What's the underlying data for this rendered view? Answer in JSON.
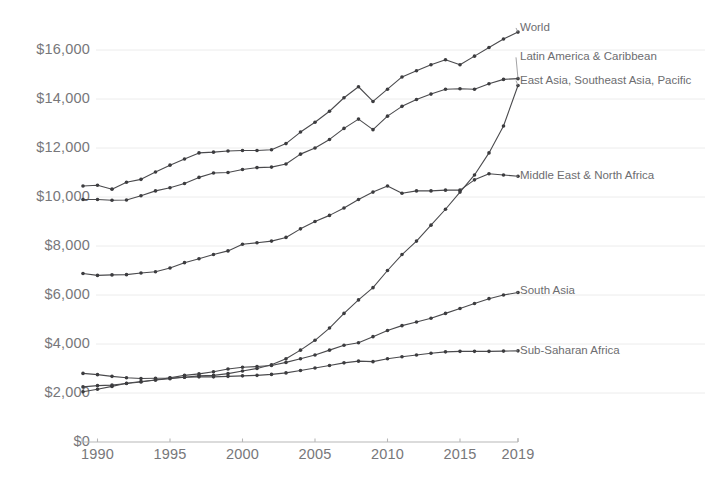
{
  "chart_data": {
    "type": "line",
    "title": "",
    "subtitle": "",
    "xlabel": "",
    "ylabel": "",
    "grid": true,
    "legend_position": "right-inline-labels",
    "xlim": [
      1989,
      2019
    ],
    "ylim": [
      0,
      17500
    ],
    "x": [
      1989,
      1990,
      1991,
      1992,
      1993,
      1994,
      1995,
      1996,
      1997,
      1998,
      1999,
      2000,
      2001,
      2002,
      2003,
      2004,
      2005,
      2006,
      2007,
      2008,
      2009,
      2010,
      2011,
      2012,
      2013,
      2014,
      2015,
      2016,
      2017,
      2018,
      2019
    ],
    "y_ticks": [
      0,
      2000,
      4000,
      6000,
      8000,
      10000,
      12000,
      14000,
      16000
    ],
    "y_tick_labels": [
      "$0",
      "$2,000",
      "$4,000",
      "$6,000",
      "$8,000",
      "$10,000",
      "$12,000",
      "$14,000",
      "$16,000"
    ],
    "x_ticks": [
      1990,
      1995,
      2000,
      2005,
      2010,
      2015,
      2019
    ],
    "x_tick_labels": [
      "1990",
      "1995",
      "2000",
      "2005",
      "2010",
      "2015",
      "2019"
    ],
    "series": [
      {
        "name": "World",
        "label": "World",
        "color": "#4a4a4d",
        "label_x": 1989,
        "label_y": 16900,
        "values": [
          10450,
          10480,
          10320,
          10600,
          10720,
          11020,
          11300,
          11550,
          11800,
          11830,
          11880,
          11900,
          11900,
          11930,
          12180,
          12650,
          13050,
          13500,
          14050,
          14500,
          13900,
          14400,
          14900,
          15150,
          15400,
          15600,
          15400,
          15750,
          16100,
          16450,
          16730
        ]
      },
      {
        "name": "Latin America & Caribbean",
        "label": "Latin America & Caribbean",
        "color": "#4a4a4d",
        "label_x": 1989,
        "label_y": 15700,
        "values": [
          9900,
          9900,
          9870,
          9880,
          10050,
          10250,
          10380,
          10550,
          10800,
          10980,
          11000,
          11120,
          11200,
          11220,
          11350,
          11750,
          12000,
          12350,
          12800,
          13180,
          12750,
          13300,
          13700,
          13980,
          14200,
          14400,
          14420,
          14400,
          14620,
          14800,
          14830
        ]
      },
      {
        "name": "East Asia, Southeast Asia, Pacific",
        "label": "East Asia, Southeast Asia, Pacific",
        "color": "#4a4a4d",
        "label_x": 1989,
        "label_y": 14750,
        "values": [
          2050,
          2150,
          2270,
          2400,
          2470,
          2530,
          2580,
          2640,
          2700,
          2720,
          2790,
          2900,
          3000,
          3150,
          3400,
          3750,
          4150,
          4650,
          5250,
          5800,
          6300,
          7000,
          7650,
          8200,
          8850,
          9500,
          10200,
          10900,
          11800,
          12900,
          14550
        ]
      },
      {
        "name": "Middle East & North Africa",
        "label": "Middle East & North Africa",
        "color": "#4a4a4d",
        "label_x": 1989,
        "label_y": 10850,
        "values": [
          6880,
          6800,
          6820,
          6830,
          6900,
          6950,
          7100,
          7320,
          7480,
          7650,
          7800,
          8070,
          8130,
          8200,
          8350,
          8700,
          9000,
          9250,
          9550,
          9900,
          10200,
          10450,
          10150,
          10250,
          10250,
          10280,
          10280,
          10700,
          10950,
          10900,
          10850
        ]
      },
      {
        "name": "South Asia",
        "label": "South Asia",
        "color": "#4a4a4d",
        "label_x": 1989,
        "label_y": 6150,
        "values": [
          2250,
          2300,
          2320,
          2390,
          2450,
          2530,
          2620,
          2720,
          2780,
          2870,
          2980,
          3050,
          3080,
          3120,
          3250,
          3400,
          3550,
          3750,
          3950,
          4050,
          4300,
          4550,
          4750,
          4900,
          5050,
          5250,
          5450,
          5650,
          5850,
          6000,
          6100
        ]
      },
      {
        "name": "Sub-Saharan Africa",
        "label": "Sub-Saharan Africa",
        "color": "#4a4a4d",
        "label_x": 1989,
        "label_y": 3720,
        "values": [
          2800,
          2750,
          2680,
          2620,
          2590,
          2600,
          2610,
          2640,
          2660,
          2660,
          2680,
          2700,
          2720,
          2760,
          2820,
          2920,
          3020,
          3120,
          3230,
          3300,
          3280,
          3400,
          3480,
          3550,
          3620,
          3680,
          3700,
          3700,
          3700,
          3710,
          3720
        ]
      }
    ]
  },
  "axes": {
    "y_axis_name": "gdp-per-capita-axis",
    "x_axis_name": "year-axis"
  }
}
